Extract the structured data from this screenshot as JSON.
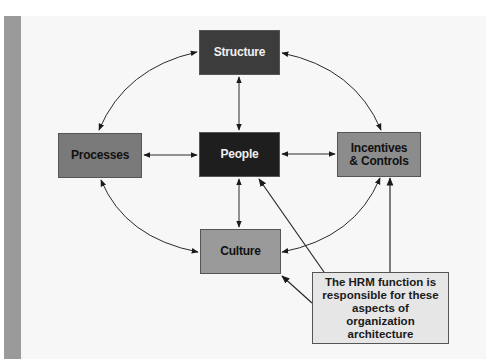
{
  "diagram": {
    "nodes": {
      "structure": {
        "label": "Structure",
        "fill": "#3c3c3c",
        "text_color": "#f0f0f0"
      },
      "people": {
        "label": "People",
        "fill": "#1e1e1e",
        "text_color": "#f0f0f0"
      },
      "processes": {
        "label": "Processes",
        "fill": "#7a7a7a",
        "text_color": "#111111"
      },
      "incentives": {
        "label": "Incentives & Controls",
        "fill": "#8c8c8c",
        "text_color": "#111111"
      },
      "culture": {
        "label": "Culture",
        "fill": "#9a9a9a",
        "text_color": "#111111"
      }
    },
    "note": {
      "label": "The HRM function is responsible for these aspects of organization architecture",
      "fill": "#e6e6e6"
    },
    "edges": [
      {
        "from": "structure",
        "to": "processes",
        "type": "curved",
        "bidirectional": true
      },
      {
        "from": "structure",
        "to": "incentives",
        "type": "curved",
        "bidirectional": true
      },
      {
        "from": "structure",
        "to": "people",
        "type": "straight",
        "bidirectional": true
      },
      {
        "from": "processes",
        "to": "people",
        "type": "straight",
        "bidirectional": true
      },
      {
        "from": "people",
        "to": "incentives",
        "type": "straight",
        "bidirectional": true
      },
      {
        "from": "people",
        "to": "culture",
        "type": "straight",
        "bidirectional": true
      },
      {
        "from": "processes",
        "to": "culture",
        "type": "curved",
        "bidirectional": true
      },
      {
        "from": "incentives",
        "to": "culture",
        "type": "curved",
        "bidirectional": true
      },
      {
        "from": "note",
        "to": "people",
        "type": "straight",
        "bidirectional": false
      },
      {
        "from": "note",
        "to": "incentives",
        "type": "straight",
        "bidirectional": false
      },
      {
        "from": "note",
        "to": "culture",
        "type": "straight",
        "bidirectional": false
      }
    ]
  }
}
